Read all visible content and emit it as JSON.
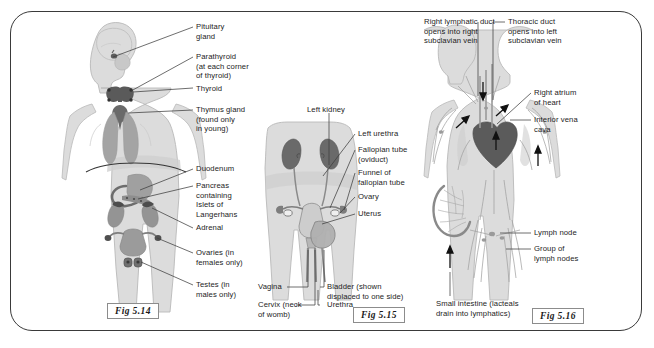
{
  "figure_plate": {
    "caption_boxes": [
      {
        "id": "fig-5-14",
        "text": "Fig 5.14"
      },
      {
        "id": "fig-5-15",
        "text": "Fig 5.15"
      },
      {
        "id": "fig-5-16",
        "text": "Fig 5.16"
      }
    ]
  },
  "fig_5_14": {
    "title": "Fig 5.14",
    "subject": "endocrine glands of the human body",
    "labels": {
      "pituitary_gland": "Pituitary\ngland",
      "parathyroid": "Parathyroid\n(at each corner\nof thyroid)",
      "thyroid": "Thyroid",
      "thymus_gland": "Thymus gland\n(found only\nin young)",
      "duodenum": "Duodenum",
      "pancreas": "Pancreas\ncontaining\nIslets of\nLangerhans",
      "adrenal": "Adrenal",
      "ovaries": "Ovaries (in\nfemales only)",
      "testes": "Testes (in\nmales only)"
    }
  },
  "fig_5_15": {
    "title": "Fig 5.15",
    "subject": "female reproductive and urinary organs",
    "labels": {
      "left_kidney": "Left kidney",
      "left_urethra": "Left urethra",
      "fallopian_tube": "Fallopian tube\n(oviduct)",
      "funnel_of_fallopian_tube": "Funnel of\nfallopian tube",
      "ovary": "Ovary",
      "uterus": "Uterus",
      "vagina": "Vagina",
      "cervix": "Cervix (neck\nof womb)",
      "bladder": "Bladder (shown\ndisplaced to one side)",
      "urethra": "Urethra"
    }
  },
  "fig_5_16": {
    "title": "Fig 5.16",
    "subject": "the lymphatic system",
    "labels": {
      "right_lymphatic_duct": "Right lymphatic duct\nopens into right\nsubclavian vein",
      "thoracic_duct": "Thoracic duct\nopens into left\nsubclavian vein",
      "right_atrium": "Right atrium\nof heart",
      "interior_vena_cava": "Interior vena\ncava",
      "lymph_node": "Lymph node",
      "group_of_lymph_nodes": "Group of\nlymph nodes",
      "small_intestine": "Small intestine (lacteals\ndrain into lymphatics)"
    }
  },
  "colors": {
    "frame_border": "#3a3a3a",
    "body_silhouette": "#dcdcdc",
    "body_outline": "#b4b4b4",
    "organ_mid": "#a8a8a8",
    "organ_dark": "#6e6e6e",
    "organ_darkest": "#4f4f4f",
    "leader_line": "#3d3d3d",
    "text": "#1c1c1c",
    "page_background": "#ffffff"
  }
}
